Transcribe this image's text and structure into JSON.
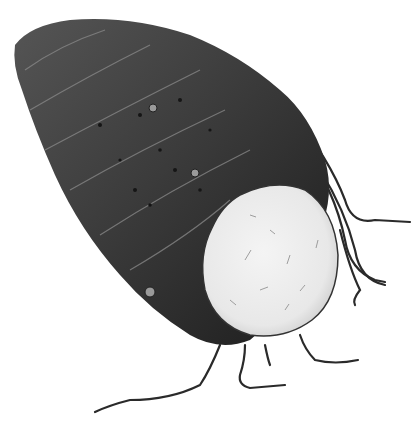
{
  "image": {
    "subject": "taro root illustration",
    "alt": "Black-and-white illustration of a taro corm with a cut face showing white flesh and trailing roots",
    "background_color": "#ffffff",
    "skin_color": "#3a3a3a",
    "skin_dark": "#1e1e1e",
    "skin_light": "#6a6a6a",
    "flesh_color": "#efefef",
    "root_color": "#2a2a2a"
  }
}
